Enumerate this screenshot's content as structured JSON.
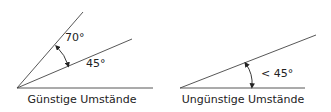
{
  "diagram": {
    "colors": {
      "line": "#333333",
      "text": "#222222",
      "background": "#ffffff"
    },
    "panels": [
      {
        "id": "favorable",
        "caption": "Günstige Umstände",
        "angle_labels": [
          "70°",
          "45°"
        ]
      },
      {
        "id": "unfavorable",
        "caption": "Ungünstige Umstände",
        "angle_labels": [
          "< 45°"
        ]
      }
    ]
  }
}
